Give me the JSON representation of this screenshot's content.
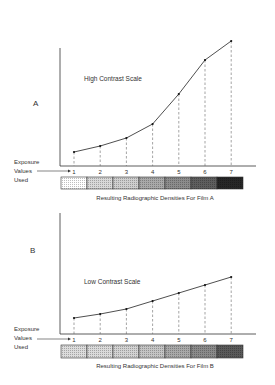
{
  "panels": [
    {
      "id": "A",
      "letter": "A",
      "curve_label": "High Contrast Scale",
      "axis_caption": [
        "Exposure",
        "Values",
        "Used"
      ],
      "strip_caption": "Resulting Radiographic Densities For Film A",
      "strip_shades": [
        "#ffffff",
        "#d9d9d9",
        "#cfcfcf",
        "#a9a9a9",
        "#8c8c8c",
        "#5e5e5e",
        "#262626"
      ]
    },
    {
      "id": "B",
      "letter": "B",
      "curve_label": "Low Contrast Scale",
      "axis_caption": [
        "Exposure",
        "Values",
        "Used"
      ],
      "strip_caption": "Resulting Radiographic Densities For Film B",
      "strip_shades": [
        "#dcdcdc",
        "#dadada",
        "#d2d2d2",
        "#c4c4c4",
        "#a8a8a8",
        "#8a8a8a",
        "#5a5a5a"
      ]
    }
  ],
  "chart_data": [
    {
      "type": "line",
      "title": "High Contrast Scale",
      "panel": "A",
      "xlabel": "Exposure Values Used",
      "ylabel": "",
      "x": [
        1,
        2,
        3,
        4,
        5,
        6,
        7
      ],
      "values": [
        0.12,
        0.18,
        0.26,
        0.4,
        0.7,
        1.04,
        1.23
      ],
      "grid": false,
      "note": "Relative curve heights (unitless; no y tick labels shown)"
    },
    {
      "type": "line",
      "title": "Low Contrast Scale",
      "panel": "B",
      "xlabel": "Exposure Values Used",
      "ylabel": "",
      "x": [
        1,
        2,
        3,
        4,
        5,
        6,
        7
      ],
      "values": [
        0.14,
        0.18,
        0.23,
        0.31,
        0.39,
        0.47,
        0.55
      ],
      "grid": false,
      "note": "Relative curve heights (unitless; no y tick labels shown)"
    }
  ]
}
